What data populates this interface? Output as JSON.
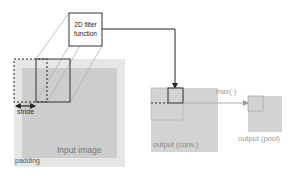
{
  "diagram": {
    "filter_box": {
      "line1": "2D filter",
      "line2": "function"
    },
    "labels": {
      "stride": "stride",
      "input_image": "Input image",
      "padding": "padding",
      "output_conv": "output (conv.)",
      "output_pool": "output (pool)",
      "max_op": "max(·)"
    },
    "colors": {
      "padding_fill": "#e6e6e6",
      "input_fill": "#cdcdcd",
      "conv_fill": "#d3d3d3",
      "pool_fill": "#d3d3d3",
      "line": "#222222",
      "label_gray": "#8a8a8a"
    }
  }
}
